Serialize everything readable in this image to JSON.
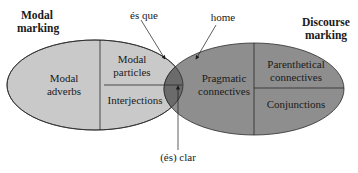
{
  "colors": {
    "modal_fill": "#c9c9c9",
    "discourse_fill": "#8e8e8e",
    "overlap_fill": "#6b6b6b",
    "stroke": "#2a2a2a",
    "background": "#ffffff"
  },
  "headings": {
    "modal_marking": [
      "Modal",
      "marking"
    ],
    "discourse_marking": [
      "Discourse",
      "marking"
    ]
  },
  "modal_ellipse": {
    "cells": {
      "modal_adverbs": [
        "Modal",
        "adverbs"
      ],
      "modal_particles": [
        "Modal",
        "particles"
      ],
      "interjections": "Interjections"
    }
  },
  "discourse_ellipse": {
    "cells": {
      "pragmatic_connectives": [
        "Pragmatic",
        "connectives"
      ],
      "parenthetical_connectives": [
        "Parenthetical",
        "connectives"
      ],
      "conjunctions": "Conjunctions"
    }
  },
  "annotations": {
    "es_que": "és que",
    "home": "home",
    "es_clar": "(és) clar"
  }
}
